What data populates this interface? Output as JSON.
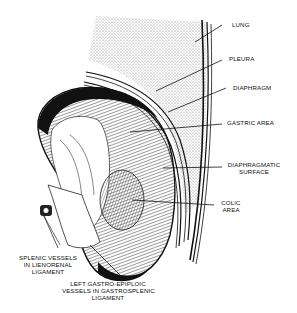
{
  "diagram": {
    "labels": {
      "lung": "LUNG",
      "pleura": "PLEURA",
      "diaphragm": "DIAPHRAGM",
      "gastric_area": "GASTRIC AREA",
      "diaphragmatic_surface_1": "DIAPHRAGMATIC",
      "diaphragmatic_surface_2": "SURFACE",
      "colic_area_1": "COLIC",
      "colic_area_2": "AREA",
      "splenic_vessels_1": "SPLENIC VESSELS",
      "splenic_vessels_2": "IN LIENORENAL",
      "splenic_vessels_3": "LIGAMENT",
      "gastro_epiploic_1": "LEFT GASTRO-EPIPLOIC",
      "gastro_epiploic_2": "VESSELS IN GASTROSPLENIC",
      "gastro_epiploic_3": "LIGAMENT"
    },
    "colors": {
      "ink": "#111111",
      "stipple": "#8a8a8a",
      "background": "#ffffff"
    }
  }
}
